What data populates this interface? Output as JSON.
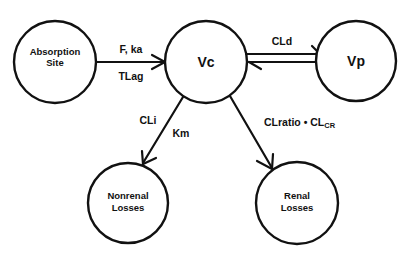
{
  "diagram": {
    "type": "pharmacokinetic-compartment-model",
    "nodes": {
      "absorption": {
        "line1": "Absorption",
        "line2": "Site"
      },
      "vc": {
        "label": "Vc"
      },
      "vp": {
        "label": "Vp"
      },
      "nonrenal": {
        "line1": "Nonrenal",
        "line2": "Losses"
      },
      "renal": {
        "line1": "Renal",
        "line2": "Losses"
      }
    },
    "edges": {
      "absorption_to_vc": {
        "top": "F, ka",
        "bottom": "TLag"
      },
      "vc_vp": {
        "label": "CLd"
      },
      "vc_to_nonrenal": {
        "left": "CLi",
        "right": "Km"
      },
      "vc_to_renal": {
        "main": "CLratio • CL",
        "sub": "CR"
      }
    },
    "colors": {
      "stroke": "#111111",
      "background": "#ffffff"
    }
  }
}
